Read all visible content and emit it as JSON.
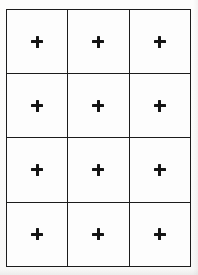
{
  "figure": {
    "kind": "grid-of-crosses",
    "background_color": "#fcfcfb",
    "cell_fill_color": "#fdfdfd",
    "line_color": "#1c1c1c",
    "mark_color": "#141414",
    "line_width_px": 1.5,
    "columns": 3,
    "rows": 4,
    "total_cells": 12,
    "bounds": {
      "left_px": 6,
      "top_px": 9,
      "right_px": 191,
      "bottom_px": 266,
      "width_px": 185,
      "height_px": 257
    },
    "cell_size": {
      "width_px": 61.7,
      "height_px": 64.2
    },
    "mark": {
      "name": "plus-cross",
      "glyph": "+",
      "arm_length_px": 12,
      "arm_thickness_px": 3
    },
    "cells": [
      {
        "row": 1,
        "column": 1,
        "mark": "+"
      },
      {
        "row": 1,
        "column": 2,
        "mark": "+"
      },
      {
        "row": 1,
        "column": 3,
        "mark": "+"
      },
      {
        "row": 2,
        "column": 1,
        "mark": "+"
      },
      {
        "row": 2,
        "column": 2,
        "mark": "+"
      },
      {
        "row": 2,
        "column": 3,
        "mark": "+"
      },
      {
        "row": 3,
        "column": 1,
        "mark": "+"
      },
      {
        "row": 3,
        "column": 2,
        "mark": "+"
      },
      {
        "row": 3,
        "column": 3,
        "mark": "+"
      },
      {
        "row": 4,
        "column": 1,
        "mark": "+"
      },
      {
        "row": 4,
        "column": 2,
        "mark": "+"
      },
      {
        "row": 4,
        "column": 3,
        "mark": "+"
      }
    ]
  }
}
